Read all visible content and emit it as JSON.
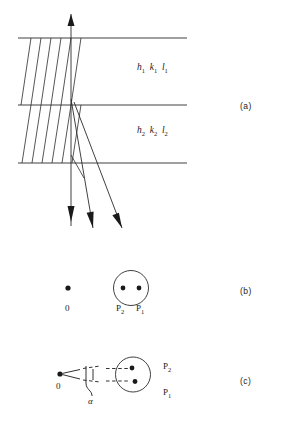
{
  "figure": {
    "panels": [
      {
        "key": "a",
        "label": "(a)"
      },
      {
        "key": "b",
        "label": "(b)"
      },
      {
        "key": "c",
        "label": "(c)"
      }
    ],
    "panel_a": {
      "layer_1_indices": {
        "h": "h",
        "k": "k",
        "l": "l",
        "subscript": "1"
      },
      "layer_2_indices": {
        "h": "h",
        "k": "k",
        "l": "l",
        "subscript": "2"
      },
      "boundary_lines": 3,
      "lattice_planes": 6,
      "incident_beam": "vertical",
      "diffracted_beams": 2
    },
    "panel_b": {
      "origin_label": "0",
      "spot_labels": [
        "P",
        "P"
      ],
      "spot_subscripts": [
        "2",
        "1"
      ],
      "p2_label": "P",
      "p2_sub": "2",
      "p1_label": "P",
      "p1_sub": "1",
      "zero_label": "0"
    },
    "panel_c": {
      "zero_label": "0",
      "p2_label": "P",
      "p2_sub": "2",
      "p1_label": "P",
      "p1_sub": "1",
      "angle_label": "α"
    }
  },
  "colors": {
    "ink": "#1a1a1a",
    "line": "#2b2b2b",
    "background": "#ffffff"
  }
}
